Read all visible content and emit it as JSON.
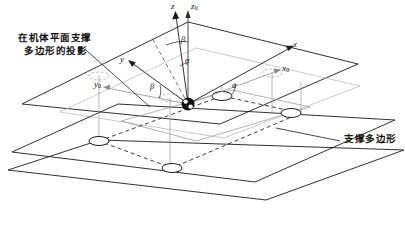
{
  "figure": {
    "type": "technical-diagram",
    "background": "#ffffff",
    "line_color": "#1a1a1a",
    "ghost_color": "#b8b8b8",
    "width": 405,
    "height": 225
  },
  "annotations": {
    "left_label_line1": "在机体平面支撑",
    "left_label_line2": "多边形的投影",
    "right_label": "支撑多边形"
  },
  "axes": [
    {
      "name": "z",
      "label": "z",
      "sub": "",
      "frame": "body"
    },
    {
      "name": "z0",
      "label": "z",
      "sub": "0",
      "frame": "world"
    },
    {
      "name": "x",
      "label": "x",
      "sub": "",
      "frame": "body"
    },
    {
      "name": "x0",
      "label": "x",
      "sub": "0",
      "frame": "world"
    },
    {
      "name": "y",
      "label": "y",
      "sub": "",
      "frame": "body"
    },
    {
      "name": "y0",
      "label": "y",
      "sub": "0",
      "frame": "world"
    }
  ],
  "angles": [
    {
      "name": "beta-z",
      "label": "β",
      "location": "between z and z0 axes"
    },
    {
      "name": "alpha-z",
      "label": "α",
      "location": "below beta on z axis"
    },
    {
      "name": "beta-y",
      "label": "β",
      "location": "between y and y0 in plane"
    },
    {
      "name": "alpha-x",
      "label": "α",
      "location": "between x and x0 in plane"
    }
  ],
  "origin": {
    "name": "body-center-of-mass",
    "marker": "filled-circle"
  },
  "planes": [
    {
      "name": "body-plane",
      "style": "solid"
    },
    {
      "name": "support-plane",
      "style": "solid"
    },
    {
      "name": "ground-plane",
      "style": "solid"
    }
  ],
  "support_polygon": {
    "style": "dashed",
    "vertices": 4
  },
  "foot_points": {
    "solid_count": 4,
    "ghost_count": 3,
    "shape": "ellipse"
  }
}
